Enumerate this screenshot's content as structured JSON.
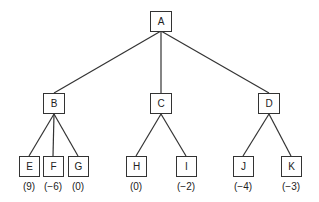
{
  "tree": {
    "root": {
      "id": "A",
      "label": "A"
    },
    "level1": [
      {
        "id": "B",
        "label": "B"
      },
      {
        "id": "C",
        "label": "C"
      },
      {
        "id": "D",
        "label": "D"
      }
    ],
    "leaves": [
      {
        "id": "E",
        "label": "E",
        "parent": "B",
        "value": "(9)"
      },
      {
        "id": "F",
        "label": "F",
        "parent": "B",
        "value": "(−6)"
      },
      {
        "id": "G",
        "label": "G",
        "parent": "B",
        "value": "(0)"
      },
      {
        "id": "H",
        "label": "H",
        "parent": "C",
        "value": "(0)"
      },
      {
        "id": "I",
        "label": "I",
        "parent": "C",
        "value": "(−2)"
      },
      {
        "id": "J",
        "label": "J",
        "parent": "D",
        "value": "(−4)"
      },
      {
        "id": "K",
        "label": "K",
        "parent": "D",
        "value": "(−3)"
      }
    ]
  }
}
